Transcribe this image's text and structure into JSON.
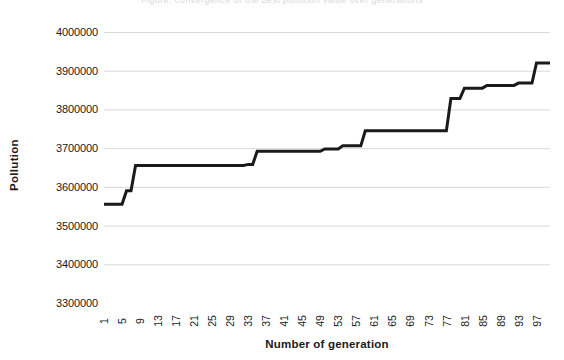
{
  "top_clip_text": "Figure: convergence of the best pollution value over generations",
  "chart_data": {
    "type": "line",
    "title": "",
    "xlabel": "Number of generation",
    "ylabel": "Pollution",
    "xlim": [
      1,
      100
    ],
    "ylim": [
      3300000,
      4000000
    ],
    "y_ticks": [
      4000000,
      3900000,
      3800000,
      3700000,
      3600000,
      3500000,
      3400000,
      3300000
    ],
    "y_tick_labels": [
      "4000000",
      "3900000",
      "3800000",
      "3700000",
      "3600000",
      "3500000",
      "3400000",
      "3300000"
    ],
    "x_ticks": [
      1,
      5,
      9,
      13,
      17,
      21,
      25,
      29,
      33,
      37,
      41,
      45,
      49,
      53,
      57,
      61,
      65,
      69,
      73,
      77,
      81,
      85,
      89,
      93,
      97
    ],
    "x_tick_labels": [
      "1",
      "5",
      "9",
      "13",
      "17",
      "21",
      "25",
      "29",
      "33",
      "37",
      "41",
      "45",
      "49",
      "53",
      "57",
      "61",
      "65",
      "69",
      "73",
      "77",
      "81",
      "85",
      "89",
      "93",
      "97"
    ],
    "grid": "horizontal",
    "legend": "none",
    "line_color": "#1a1a1a",
    "line_width": 3,
    "gridline_color": "#d9d9d9",
    "series": [
      {
        "name": "Pollution",
        "x": [
          1,
          2,
          3,
          4,
          5,
          6,
          7,
          8,
          9,
          10,
          11,
          12,
          13,
          14,
          15,
          16,
          17,
          18,
          19,
          20,
          21,
          22,
          23,
          24,
          25,
          26,
          27,
          28,
          29,
          30,
          31,
          32,
          33,
          34,
          35,
          36,
          37,
          38,
          39,
          40,
          41,
          42,
          43,
          44,
          45,
          46,
          47,
          48,
          49,
          50,
          51,
          52,
          53,
          54,
          55,
          56,
          57,
          58,
          59,
          60,
          61,
          62,
          63,
          64,
          65,
          66,
          67,
          68,
          69,
          70,
          71,
          72,
          73,
          74,
          75,
          76,
          77,
          78,
          79,
          80,
          81,
          82,
          83,
          84,
          85,
          86,
          87,
          88,
          89,
          90,
          91,
          92,
          93,
          94,
          95,
          96,
          97,
          98,
          99,
          100
        ],
        "values": [
          3555000,
          3555000,
          3555000,
          3555000,
          3555000,
          3590000,
          3590000,
          3655000,
          3655000,
          3655000,
          3655000,
          3655000,
          3655000,
          3655000,
          3655000,
          3655000,
          3655000,
          3655000,
          3655000,
          3655000,
          3655000,
          3655000,
          3655000,
          3655000,
          3655000,
          3655000,
          3655000,
          3655000,
          3655000,
          3655000,
          3655000,
          3655000,
          3658000,
          3658000,
          3692000,
          3692000,
          3692000,
          3692000,
          3692000,
          3692000,
          3692000,
          3692000,
          3692000,
          3692000,
          3692000,
          3692000,
          3692000,
          3692000,
          3692000,
          3698000,
          3698000,
          3698000,
          3698000,
          3706000,
          3706000,
          3706000,
          3706000,
          3706000,
          3745000,
          3745000,
          3745000,
          3745000,
          3745000,
          3745000,
          3745000,
          3745000,
          3745000,
          3745000,
          3745000,
          3745000,
          3745000,
          3745000,
          3745000,
          3745000,
          3745000,
          3745000,
          3745000,
          3828000,
          3828000,
          3828000,
          3855000,
          3855000,
          3855000,
          3855000,
          3855000,
          3862000,
          3862000,
          3862000,
          3862000,
          3862000,
          3862000,
          3862000,
          3868000,
          3868000,
          3868000,
          3868000,
          3920000,
          3920000,
          3920000,
          3920000
        ]
      }
    ]
  }
}
